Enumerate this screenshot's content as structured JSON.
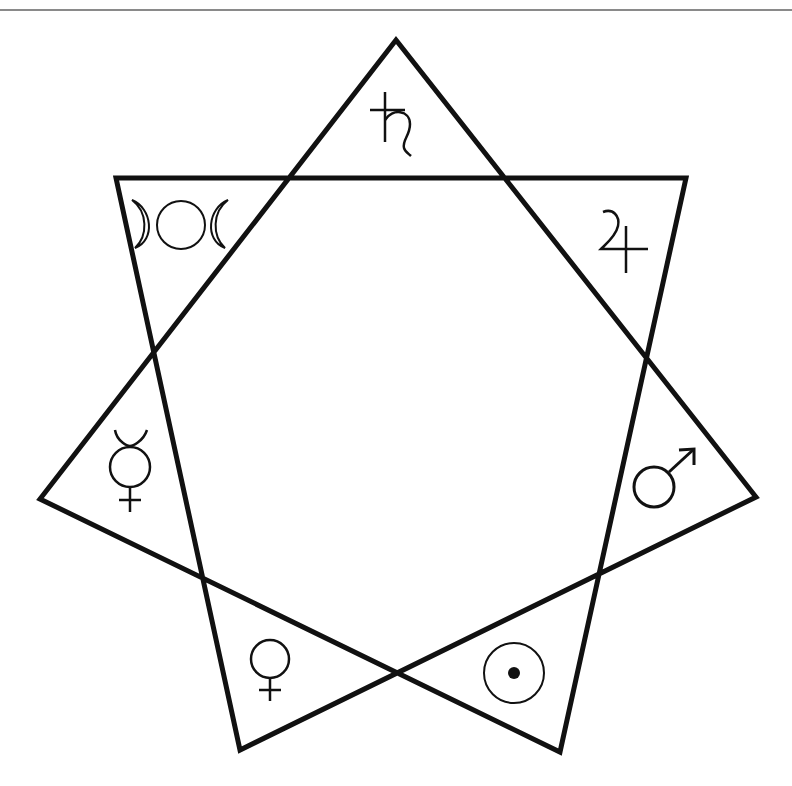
{
  "figure": {
    "type": "heptagram",
    "schlafli": "{7/2}",
    "stroke_color": "#111111",
    "stroke_width": 5,
    "vertices": [
      {
        "name": "top",
        "x": 396,
        "y": 40
      },
      {
        "name": "top-right",
        "x": 686,
        "y": 178
      },
      {
        "name": "right",
        "x": 756,
        "y": 497
      },
      {
        "name": "bottom-right",
        "x": 560,
        "y": 752
      },
      {
        "name": "bottom-left",
        "x": 240,
        "y": 750
      },
      {
        "name": "left",
        "x": 40,
        "y": 499
      },
      {
        "name": "top-left",
        "x": 116,
        "y": 178
      }
    ],
    "symbols": [
      {
        "point": "top",
        "name": "saturn",
        "glyph": "♄"
      },
      {
        "point": "top-right",
        "name": "jupiter",
        "glyph": "♃"
      },
      {
        "point": "right",
        "name": "mars",
        "glyph": "♂"
      },
      {
        "point": "bottom-right",
        "name": "sun",
        "glyph": "☉"
      },
      {
        "point": "bottom-left",
        "name": "venus",
        "glyph": "♀"
      },
      {
        "point": "left",
        "name": "mercury",
        "glyph": "☿"
      },
      {
        "point": "top-left",
        "name": "moon-triple",
        "glyph": "☽○☾"
      }
    ]
  }
}
